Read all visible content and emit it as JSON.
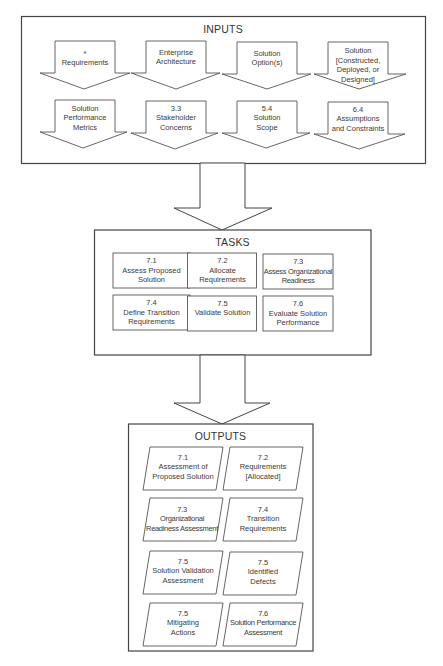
{
  "inputs": {
    "title": "INPUTS",
    "items": [
      {
        "num": "*",
        "line1": "Requirements",
        "line2": "",
        "line3": ""
      },
      {
        "num": "",
        "line1": "Enterprise",
        "line2": "Architecture",
        "line3": ""
      },
      {
        "num": "",
        "line1": "Solution",
        "line2": "Option(s)",
        "line3": ""
      },
      {
        "num": "Solution",
        "line1": "[Constructed,",
        "line2": "Deployed, or",
        "line3": "Designed]"
      },
      {
        "num": "",
        "line1": "Solution",
        "line2": "Performance",
        "line3": "Metrics"
      },
      {
        "num": "3.3",
        "line1": "Stakeholder",
        "line2": "Concerns",
        "line3": ""
      },
      {
        "num": "5.4",
        "line1": "Solution",
        "line2": "Scope",
        "line3": ""
      },
      {
        "num": "6.4",
        "line1": "Assumptions",
        "line2": "and Constraints",
        "line3": ""
      }
    ]
  },
  "tasks": {
    "title": "TASKS",
    "items": [
      {
        "num": "7.1",
        "line1": "Assess Proposed",
        "line2": "Solution"
      },
      {
        "num": "7.2",
        "line1": "Allocate",
        "line2": "Requirements"
      },
      {
        "num": "7.3",
        "line1": "Assess Organizational",
        "line2": "Readiness"
      },
      {
        "num": "7.4",
        "line1": "Define Transition",
        "line2": "Requirements"
      },
      {
        "num": "7.5",
        "line1": "Validate Solution",
        "line2": ""
      },
      {
        "num": "7.6",
        "line1": "Evaluate Solution",
        "line2": "Performance"
      }
    ]
  },
  "outputs": {
    "title": "OUTPUTS",
    "items": [
      {
        "num": "7.1",
        "line1": "Assessment of",
        "line2": "Proposed Solution"
      },
      {
        "num": "7.2",
        "line1": "Requirements",
        "line2": "[Allocated]"
      },
      {
        "num": "7.3",
        "line1": "Organizational",
        "line2": "Readiness Assessment"
      },
      {
        "num": "7.4",
        "line1": "Transition",
        "line2": "Requirements"
      },
      {
        "num": "7.5",
        "line1": "Solution Validation",
        "line2": "Assessment"
      },
      {
        "num": "7.5",
        "line1": "Identified",
        "line2": "Defects"
      },
      {
        "num": "7.5",
        "line1": "Mitigating",
        "line2": "Actions"
      },
      {
        "num": "7.6",
        "line1": "Solution Performance",
        "line2": "Assessment"
      }
    ]
  }
}
